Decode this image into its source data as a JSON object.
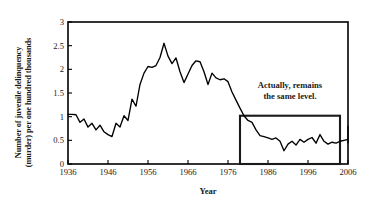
{
  "chart_data": {
    "type": "line",
    "title": "",
    "xlabel": "Year",
    "ylabel_line1": "Number of juvenile delinquency",
    "ylabel_line2": "(murder) per one hundred thousands",
    "xlim": [
      1936,
      2006
    ],
    "ylim": [
      0,
      3
    ],
    "xticks": [
      1936,
      1946,
      1956,
      1966,
      1976,
      1986,
      1996,
      2006
    ],
    "xtick_labels": [
      "1936",
      "1946",
      "1956",
      "1966",
      "1976",
      "1986",
      "1996",
      "2006"
    ],
    "yticks": [
      0,
      0.5,
      1,
      1.5,
      2,
      2.5,
      3
    ],
    "ytick_labels": [
      "0",
      "0.5",
      "1",
      "1.5",
      "2",
      "2.5",
      "3"
    ],
    "grid": false,
    "legend": "none",
    "line_color": "#000000",
    "series": [
      {
        "name": "Juvenile delinquency (murder) rate per 100,000",
        "x": [
          1936,
          1937,
          1938,
          1939,
          1940,
          1941,
          1942,
          1943,
          1944,
          1945,
          1946,
          1947,
          1948,
          1949,
          1950,
          1951,
          1952,
          1953,
          1954,
          1955,
          1956,
          1957,
          1958,
          1959,
          1960,
          1961,
          1962,
          1963,
          1964,
          1965,
          1966,
          1967,
          1968,
          1969,
          1970,
          1971,
          1972,
          1973,
          1974,
          1975,
          1976,
          1977,
          1978,
          1979,
          1980,
          1981,
          1982,
          1983,
          1984,
          1985,
          1986,
          1987,
          1988,
          1989,
          1990,
          1991,
          1992,
          1993,
          1994,
          1995,
          1996,
          1997,
          1998,
          1999,
          2000,
          2001,
          2002,
          2003,
          2004,
          2005,
          2006
        ],
        "values": [
          1.05,
          1.05,
          1.04,
          0.88,
          0.95,
          0.78,
          0.86,
          0.72,
          0.82,
          0.68,
          0.62,
          0.58,
          0.86,
          0.78,
          1.02,
          0.92,
          1.37,
          1.22,
          1.68,
          1.92,
          2.06,
          2.04,
          2.08,
          2.25,
          2.55,
          2.28,
          2.12,
          2.24,
          1.95,
          1.72,
          1.9,
          2.08,
          2.18,
          2.16,
          1.95,
          1.68,
          1.92,
          1.82,
          1.78,
          1.8,
          1.74,
          1.52,
          1.35,
          1.18,
          1.02,
          0.92,
          0.88,
          0.72,
          0.6,
          0.58,
          0.55,
          0.52,
          0.55,
          0.48,
          0.28,
          0.42,
          0.48,
          0.4,
          0.52,
          0.46,
          0.52,
          0.56,
          0.44,
          0.62,
          0.48,
          0.42,
          0.46,
          0.44,
          0.48,
          0.5,
          0.52
        ],
        "values_tail": [
          0.56,
          0.62,
          0.8,
          0.72,
          0.78,
          0.74,
          0.8,
          0.68,
          0.45,
          0.58,
          0.6
        ]
      }
    ],
    "annotations": [
      {
        "name": "callout-text",
        "text_line1": "Actually, remains",
        "text_line2": "the same level.",
        "x_px": 290,
        "y_px": 87
      },
      {
        "name": "highlight-box",
        "x_range": [
          1979,
          2004
        ],
        "y_range": [
          0,
          1.02
        ],
        "color": "#1a1a1a"
      }
    ]
  }
}
